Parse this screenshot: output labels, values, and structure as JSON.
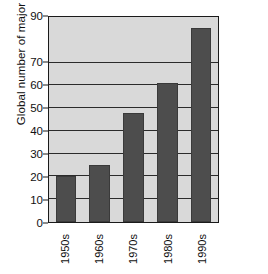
{
  "chart_data": {
    "type": "bar",
    "title": "",
    "subtitle": "",
    "xlabel": "",
    "ylabel": "Global number of major disasters",
    "categories": [
      "1950s",
      "1960s",
      "1970s",
      "1980s",
      "1990s"
    ],
    "values": [
      20,
      25,
      48,
      61,
      85
    ],
    "series": [
      {
        "name": "Global number of major disasters",
        "values": [
          20,
          25,
          48,
          61,
          85
        ]
      }
    ],
    "ylim": [
      0,
      90
    ],
    "yticks": [
      0,
      10,
      20,
      30,
      40,
      50,
      60,
      70,
      90
    ],
    "ytick_labels": [
      "0",
      "10",
      "20",
      "30",
      "40",
      "50",
      "60",
      "70",
      "90"
    ],
    "grid": "horizontal",
    "legend": "none",
    "colors": {
      "bar_fill": "#4d4d4d",
      "bar_edge": "#3a3a3a",
      "plot_background": "#d9d9d9",
      "gridline": "#2b2b2b",
      "axis_border": "#1a1a1a",
      "text": "#111111",
      "page_background": "#ffffff"
    }
  }
}
